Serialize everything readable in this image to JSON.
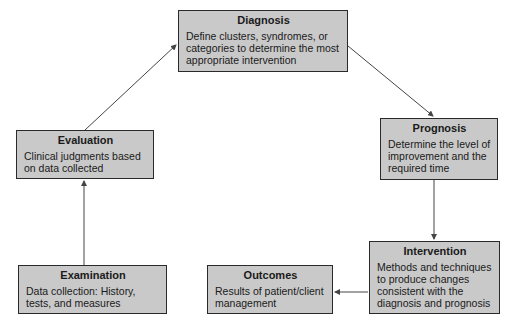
{
  "diagram": {
    "nodes": [
      {
        "id": "diagnosis",
        "title": "Diagnosis",
        "description": "Define clusters, syndromes, or categories to determine the most appropriate intervention"
      },
      {
        "id": "prognosis",
        "title": "Prognosis",
        "description": "Determine the level of improvement and the required time"
      },
      {
        "id": "intervention",
        "title": "Intervention",
        "description": "Methods and techniques to produce changes consistent with the diagnosis and prognosis"
      },
      {
        "id": "outcomes",
        "title": "Outcomes",
        "description": "Results of patient/client management"
      },
      {
        "id": "examination",
        "title": "Examination",
        "description": "Data collection: History, tests, and measures"
      },
      {
        "id": "evaluation",
        "title": "Evaluation",
        "description": "Clinical judgments based on data collected"
      }
    ],
    "edges": [
      {
        "from": "examination",
        "to": "evaluation"
      },
      {
        "from": "evaluation",
        "to": "diagnosis"
      },
      {
        "from": "diagnosis",
        "to": "prognosis"
      },
      {
        "from": "prognosis",
        "to": "intervention"
      },
      {
        "from": "intervention",
        "to": "outcomes"
      }
    ],
    "colors": {
      "box_fill": "#c9c9c9",
      "box_border": "#2a2a2a",
      "arrow": "#444444"
    }
  }
}
